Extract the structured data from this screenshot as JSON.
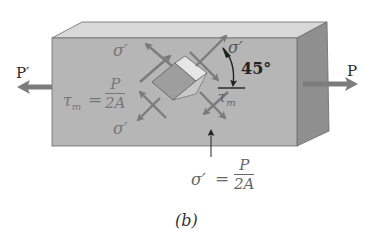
{
  "figure": {
    "caption": "(b)",
    "labels": {
      "load_left": "P′",
      "load_right": "P",
      "angle": "45°",
      "sigma_top_left": "σ′",
      "sigma_top_right": "σ′",
      "sigma_bottom_left": "σ′",
      "tau_right": "τ",
      "tau_right_sub": "m",
      "tau_eq_lhs": "τ",
      "tau_eq_sub": "m",
      "tau_eq_sign": "=",
      "tau_eq_num": "P",
      "tau_eq_den": "2A",
      "sigma_eq_lhs": "σ′",
      "sigma_eq_sign": "=",
      "sigma_eq_num": "P",
      "sigma_eq_den": "2A"
    },
    "colors": {
      "front_face": "#b4b4b4",
      "top_face": "#d6d6d6",
      "side_face": "#8e8e8e",
      "arrow": "#7c7c7c",
      "text": "#2a2a2a"
    }
  }
}
